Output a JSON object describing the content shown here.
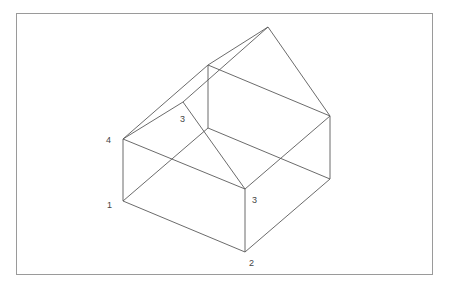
{
  "diagram": {
    "labels": [
      {
        "id": "label-4",
        "text": "4"
      },
      {
        "id": "label-1",
        "text": "1"
      },
      {
        "id": "label-2",
        "text": "2"
      },
      {
        "id": "label-3-front",
        "text": "3"
      },
      {
        "id": "label-3-roof",
        "text": "3"
      }
    ],
    "line_color": "#5a5a5a",
    "frame_color": "#9a9a9a"
  }
}
